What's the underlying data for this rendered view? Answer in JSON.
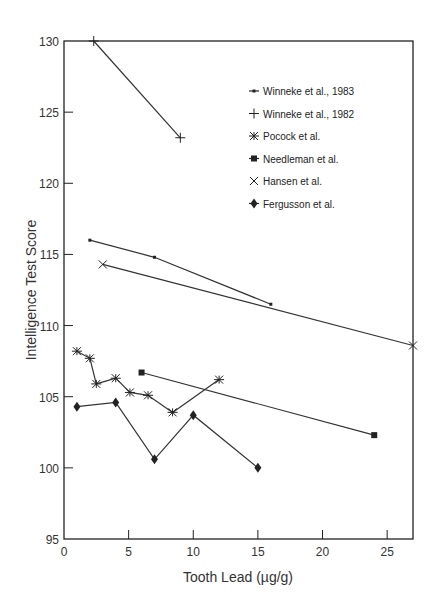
{
  "chart_data": {
    "type": "line",
    "title": "",
    "xlabel": "Tooth Lead (µg/g)",
    "ylabel": "Intelligence Test Score",
    "xlim": [
      0,
      27
    ],
    "ylim": [
      95,
      130
    ],
    "xticks": [
      0,
      5,
      10,
      15,
      20,
      25
    ],
    "yticks": [
      95,
      100,
      105,
      110,
      115,
      120,
      125,
      130
    ],
    "grid": false,
    "legend_position": "upper right",
    "series": [
      {
        "name": "Winneke et al., 1983",
        "marker": "small-square",
        "points": [
          [
            2,
            116.0
          ],
          [
            7,
            114.8
          ],
          [
            16,
            111.5
          ]
        ]
      },
      {
        "name": "Winneke et al., 1982",
        "marker": "plus",
        "points": [
          [
            2.3,
            130.0
          ],
          [
            9,
            123.2
          ]
        ]
      },
      {
        "name": "Pocock et al.",
        "marker": "asterisk",
        "points": [
          [
            1,
            108.2
          ],
          [
            2,
            107.7
          ],
          [
            2.5,
            105.9
          ],
          [
            4,
            106.3
          ],
          [
            5.1,
            105.3
          ],
          [
            6.5,
            105.1
          ],
          [
            8.4,
            103.9
          ],
          [
            12,
            106.2
          ]
        ]
      },
      {
        "name": "Needleman et al.",
        "marker": "square",
        "points": [
          [
            6,
            106.7
          ],
          [
            24,
            102.3
          ]
        ]
      },
      {
        "name": "Hansen et al.",
        "marker": "x-cross",
        "points": [
          [
            3,
            114.3
          ],
          [
            27,
            108.6
          ]
        ]
      },
      {
        "name": "Fergusson et al.",
        "marker": "diamond",
        "points": [
          [
            1,
            104.3
          ],
          [
            4,
            104.6
          ],
          [
            7,
            100.6
          ],
          [
            10,
            103.7
          ],
          [
            15,
            100.0
          ]
        ]
      }
    ]
  },
  "labels": {
    "x_axis_title": "Tooth Lead (µg/g)",
    "y_axis_title": "Intelligence Test Score"
  }
}
